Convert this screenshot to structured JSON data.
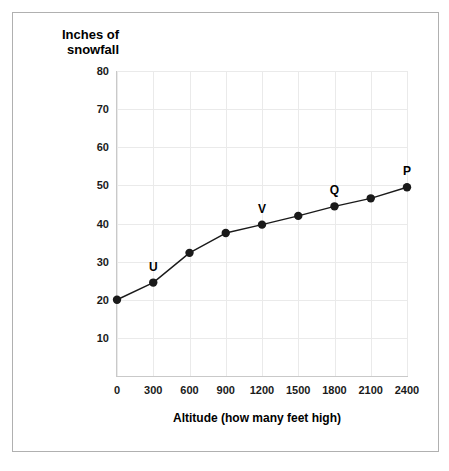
{
  "chart_data": {
    "type": "line",
    "title": "",
    "xlabel": "Altitude (how many feet high)",
    "ylabel": "Inches of snowfall",
    "ylabel_line1": "Inches of",
    "ylabel_line2": "snowfall",
    "xlim": [
      0,
      2400
    ],
    "ylim": [
      0,
      80
    ],
    "grid": true,
    "legend": "none",
    "xticks": [
      0,
      300,
      600,
      900,
      1200,
      1500,
      1800,
      2100,
      2400
    ],
    "xtick_labels": [
      "0",
      "300",
      "600",
      "900",
      "1200",
      "1500",
      "1800",
      "2100",
      "2400"
    ],
    "yticks": [
      10,
      20,
      30,
      40,
      50,
      60,
      70,
      80
    ],
    "ytick_labels": [
      "10",
      "20",
      "30",
      "40",
      "50",
      "60",
      "70",
      "80"
    ],
    "series": [
      {
        "name": "snowfall",
        "color": "#1a1a1a",
        "x": [
          0,
          300,
          600,
          900,
          1200,
          1500,
          1800,
          2100,
          2400
        ],
        "values": [
          20,
          24.5,
          32.3,
          37.5,
          39.7,
          42,
          44.5,
          46.6,
          49.5
        ],
        "point_labels": [
          "",
          "U",
          "",
          "",
          "V",
          "",
          "Q",
          "",
          "P"
        ]
      }
    ],
    "annotations": [
      {
        "label": "U",
        "x": 300,
        "y": 24.5
      },
      {
        "label": "V",
        "x": 1200,
        "y": 39.7
      },
      {
        "label": "Q",
        "x": 1800,
        "y": 44.5
      },
      {
        "label": "P",
        "x": 2400,
        "y": 49.5
      }
    ]
  }
}
